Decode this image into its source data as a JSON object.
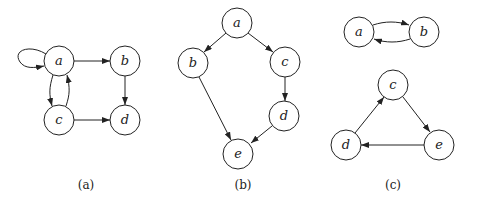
{
  "figure": {
    "panels": [
      {
        "id": "a",
        "caption": "(a)",
        "caption_pos": [
          86,
          189
        ],
        "nodes": [
          {
            "label": "a",
            "x": 59,
            "y": 61
          },
          {
            "label": "b",
            "x": 125,
            "y": 61
          },
          {
            "label": "c",
            "x": 59,
            "y": 120
          },
          {
            "label": "d",
            "x": 125,
            "y": 120
          }
        ],
        "edges": [
          {
            "from": "a",
            "to": "a",
            "type": "self-loop"
          },
          {
            "from": "a",
            "to": "b"
          },
          {
            "from": "a",
            "to": "c"
          },
          {
            "from": "c",
            "to": "a"
          },
          {
            "from": "b",
            "to": "d"
          },
          {
            "from": "c",
            "to": "d"
          }
        ]
      },
      {
        "id": "b",
        "caption": "(b)",
        "caption_pos": [
          243,
          189
        ],
        "nodes": [
          {
            "label": "a",
            "x": 237,
            "y": 23
          },
          {
            "label": "b",
            "x": 193,
            "y": 63
          },
          {
            "label": "c",
            "x": 285,
            "y": 62
          },
          {
            "label": "d",
            "x": 284,
            "y": 116
          },
          {
            "label": "e",
            "x": 238,
            "y": 154
          }
        ],
        "edges": [
          {
            "from": "a",
            "to": "b"
          },
          {
            "from": "a",
            "to": "c"
          },
          {
            "from": "c",
            "to": "d"
          },
          {
            "from": "b",
            "to": "e"
          },
          {
            "from": "d",
            "to": "e"
          }
        ]
      },
      {
        "id": "c",
        "caption": "(c)",
        "caption_pos": [
          393,
          189
        ],
        "nodes": [
          {
            "label": "a",
            "x": 359,
            "y": 32
          },
          {
            "label": "b",
            "x": 424,
            "y": 32
          },
          {
            "label": "c",
            "x": 393,
            "y": 85
          },
          {
            "label": "d",
            "x": 346,
            "y": 145
          },
          {
            "label": "e",
            "x": 439,
            "y": 145
          }
        ],
        "edges": [
          {
            "from": "a",
            "to": "b"
          },
          {
            "from": "b",
            "to": "a"
          },
          {
            "from": "c",
            "to": "e"
          },
          {
            "from": "e",
            "to": "d"
          },
          {
            "from": "d",
            "to": "c"
          }
        ]
      }
    ],
    "node_radius": 15
  }
}
